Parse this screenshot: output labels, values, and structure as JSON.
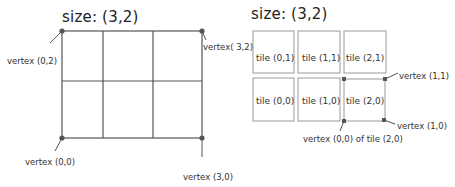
{
  "left_panel": {
    "title": "size: (3,2)",
    "grid": {
      "cols": 3,
      "rows": 2
    },
    "vertices": {
      "top_left": "vertex (0,2)",
      "top_right": "vertex( 3,2)",
      "bottom_left": "vertex (0,0)",
      "bottom_right": "vertex (3,0)"
    }
  },
  "right_panel": {
    "title": "size: (3,2)",
    "tiles": [
      {
        "label": "tile (0,1)"
      },
      {
        "label": "tile (1,1)"
      },
      {
        "label": "tile (2,1)"
      },
      {
        "label": "tile (0,0)"
      },
      {
        "label": "tile (1,0)"
      },
      {
        "label": "tile (2,0)"
      }
    ],
    "vertices": {
      "v11": "vertex (1,1)",
      "v10": "vertex (1,0)",
      "v00": "vertex (0,0) of tile (2,0)"
    }
  },
  "colors": {
    "grid_line": "#555555",
    "tile_border": "#999999",
    "vertex_dot": "#555555"
  }
}
